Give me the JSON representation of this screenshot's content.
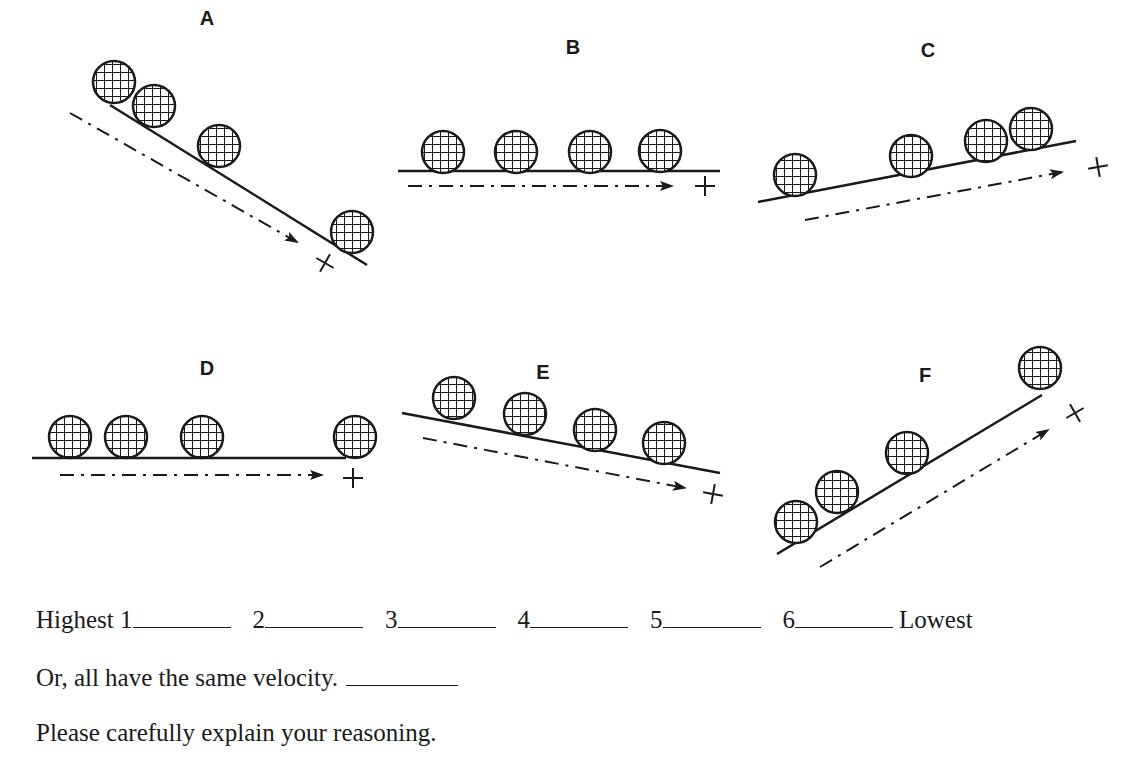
{
  "panels": [
    {
      "label": "A",
      "orientation": "downhill-steep",
      "label_pos": [
        207,
        25
      ],
      "track": [
        [
          110,
          105
        ],
        [
          367,
          265
        ]
      ],
      "balls": [
        [
          114,
          82
        ],
        [
          154,
          106
        ],
        [
          219,
          146
        ],
        [
          352,
          232
        ]
      ],
      "arrow": [
        [
          70,
          113
        ],
        [
          297,
          242
        ]
      ],
      "cross": [
        325,
        263
      ],
      "cross_rot": 30
    },
    {
      "label": "B",
      "orientation": "level",
      "label_pos": [
        573,
        54
      ],
      "track": [
        [
          398,
          171
        ],
        [
          720,
          171
        ]
      ],
      "balls": [
        [
          443,
          152
        ],
        [
          516,
          152
        ],
        [
          590,
          152
        ],
        [
          660,
          151
        ]
      ],
      "arrow": [
        [
          408,
          186
        ],
        [
          672,
          186
        ]
      ],
      "cross": [
        705,
        186
      ],
      "cross_rot": 0
    },
    {
      "label": "C",
      "orientation": "uphill-gentle",
      "label_pos": [
        928,
        57
      ],
      "track": [
        [
          758,
          202
        ],
        [
          1076,
          141
        ]
      ],
      "balls": [
        [
          795,
          175
        ],
        [
          911,
          156
        ],
        [
          986,
          141
        ],
        [
          1031,
          129
        ]
      ],
      "arrow": [
        [
          805,
          220
        ],
        [
          1062,
          172
        ]
      ],
      "cross": [
        1098,
        167
      ],
      "cross_rot": -10
    },
    {
      "label": "D",
      "orientation": "level",
      "label_pos": [
        207,
        375
      ],
      "track": [
        [
          32,
          458
        ],
        [
          346,
          458
        ]
      ],
      "balls": [
        [
          70,
          437
        ],
        [
          126,
          437
        ],
        [
          202,
          437
        ],
        [
          355,
          437
        ]
      ],
      "arrow": [
        [
          60,
          475
        ],
        [
          322,
          475
        ]
      ],
      "cross": [
        353,
        478
      ],
      "cross_rot": 0
    },
    {
      "label": "E",
      "orientation": "downhill-gentle",
      "label_pos": [
        543,
        379
      ],
      "track": [
        [
          402,
          413
        ],
        [
          720,
          473
        ]
      ],
      "balls": [
        [
          454,
          398
        ],
        [
          525,
          414
        ],
        [
          595,
          430
        ],
        [
          664,
          443
        ]
      ],
      "arrow": [
        [
          423,
          438
        ],
        [
          685,
          488
        ]
      ],
      "cross": [
        713,
        494
      ],
      "cross_rot": 10
    },
    {
      "label": "F",
      "orientation": "uphill-steep",
      "label_pos": [
        925,
        382
      ],
      "track": [
        [
          777,
          554
        ],
        [
          1042,
          395
        ]
      ],
      "balls": [
        [
          796,
          522
        ],
        [
          837,
          492
        ],
        [
          907,
          453
        ],
        [
          1040,
          368
        ]
      ],
      "arrow": [
        [
          820,
          567
        ],
        [
          1048,
          430
        ]
      ],
      "cross": [
        1075,
        413
      ],
      "cross_rot": -30
    }
  ],
  "ball_radius": 21,
  "ranking": {
    "highest_label": "Highest",
    "lowest_label": "Lowest",
    "ranks": [
      "1",
      "2",
      "3",
      "4",
      "5",
      "6"
    ]
  },
  "same_velocity_label": "Or, all have the same velocity.",
  "explain_prompt": "Please carefully explain your reasoning."
}
